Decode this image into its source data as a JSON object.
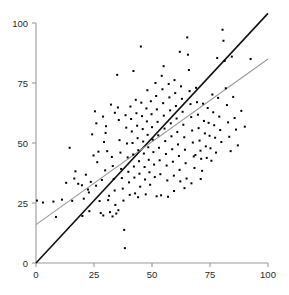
{
  "chart_data": {
    "type": "scatter",
    "title": "",
    "xlabel": "",
    "ylabel": "",
    "xlim": [
      0,
      100
    ],
    "ylim": [
      0,
      100
    ],
    "xticks": [
      0,
      25,
      50,
      75,
      100
    ],
    "yticks": [
      0,
      25,
      50,
      75,
      100
    ],
    "xticklabels": [
      "0",
      "25",
      "50",
      "75",
      "100"
    ],
    "yticklabels": [
      "0",
      "25",
      "50",
      "75",
      "100"
    ],
    "grid": false,
    "legend": null,
    "marker": "square",
    "marker_size": 2,
    "marker_color": "#000000",
    "axis_color": "#999999",
    "background_color": "#ffffff",
    "lines": [
      {
        "name": "identity-line",
        "color": "#111111",
        "width": 1.6,
        "x": [
          0,
          100
        ],
        "y": [
          0,
          104
        ],
        "slope": 1.04,
        "intercept": 0
      },
      {
        "name": "regression-line",
        "color": "#9a9a9a",
        "width": 1.1,
        "x": [
          0,
          100
        ],
        "y": [
          16,
          85
        ],
        "slope": 0.69,
        "intercept": 16
      }
    ],
    "points": [
      [
        0.4,
        26.0
      ],
      [
        3.0,
        25.2
      ],
      [
        7.5,
        25.6
      ],
      [
        8.6,
        19.2
      ],
      [
        11.2,
        26.4
      ],
      [
        14.5,
        48.0
      ],
      [
        15.6,
        25.9
      ],
      [
        17.0,
        38.2
      ],
      [
        18.2,
        33.0
      ],
      [
        19.8,
        32.4
      ],
      [
        20.6,
        26.8
      ],
      [
        21.5,
        36.8
      ],
      [
        22.4,
        30.6
      ],
      [
        23.0,
        21.6
      ],
      [
        23.6,
        33.8
      ],
      [
        24.2,
        53.6
      ],
      [
        24.8,
        44.8
      ],
      [
        25.4,
        63.2
      ],
      [
        25.9,
        32.2
      ],
      [
        26.4,
        42.0
      ],
      [
        26.9,
        46.4
      ],
      [
        27.4,
        25.8
      ],
      [
        27.9,
        20.8
      ],
      [
        28.4,
        34.6
      ],
      [
        28.9,
        61.0
      ],
      [
        29.3,
        50.4
      ],
      [
        29.8,
        38.6
      ],
      [
        30.2,
        57.0
      ],
      [
        30.7,
        46.6
      ],
      [
        31.1,
        26.2
      ],
      [
        31.5,
        28.0
      ],
      [
        31.9,
        21.2
      ],
      [
        32.3,
        66.0
      ],
      [
        32.7,
        44.2
      ],
      [
        33.1,
        40.4
      ],
      [
        33.5,
        35.0
      ],
      [
        33.9,
        30.2
      ],
      [
        34.2,
        24.2
      ],
      [
        34.6,
        20.6
      ],
      [
        35.0,
        78.4
      ],
      [
        35.3,
        64.8
      ],
      [
        35.7,
        59.6
      ],
      [
        36.0,
        51.2
      ],
      [
        36.4,
        46.0
      ],
      [
        36.7,
        39.2
      ],
      [
        37.0,
        35.4
      ],
      [
        37.4,
        31.0
      ],
      [
        37.7,
        26.0
      ],
      [
        38.0,
        13.8
      ],
      [
        38.3,
        6.2
      ],
      [
        38.6,
        61.6
      ],
      [
        38.9,
        56.4
      ],
      [
        39.2,
        49.8
      ],
      [
        39.5,
        44.0
      ],
      [
        39.8,
        38.0
      ],
      [
        40.1,
        33.6
      ],
      [
        40.4,
        28.4
      ],
      [
        40.7,
        65.2
      ],
      [
        41.0,
        60.0
      ],
      [
        41.3,
        54.8
      ],
      [
        41.6,
        50.0
      ],
      [
        41.9,
        45.2
      ],
      [
        42.2,
        40.2
      ],
      [
        42.4,
        35.6
      ],
      [
        42.7,
        29.0
      ],
      [
        43.0,
        68.0
      ],
      [
        43.3,
        62.4
      ],
      [
        43.6,
        57.2
      ],
      [
        43.8,
        52.0
      ],
      [
        44.1,
        47.0
      ],
      [
        44.4,
        42.4
      ],
      [
        44.6,
        37.2
      ],
      [
        44.9,
        31.8
      ],
      [
        45.2,
        90.2
      ],
      [
        45.4,
        66.8
      ],
      [
        45.7,
        61.2
      ],
      [
        46.0,
        55.8
      ],
      [
        46.2,
        50.6
      ],
      [
        46.5,
        45.6
      ],
      [
        46.8,
        40.0
      ],
      [
        47.0,
        34.8
      ],
      [
        47.3,
        28.6
      ],
      [
        47.6,
        64.4
      ],
      [
        47.8,
        59.0
      ],
      [
        48.1,
        53.4
      ],
      [
        48.4,
        48.2
      ],
      [
        48.6,
        43.0
      ],
      [
        48.9,
        37.8
      ],
      [
        49.2,
        32.6
      ],
      [
        49.5,
        67.4
      ],
      [
        49.8,
        62.0
      ],
      [
        50.0,
        56.6
      ],
      [
        50.3,
        51.4
      ],
      [
        50.6,
        46.2
      ],
      [
        50.9,
        41.0
      ],
      [
        51.2,
        35.8
      ],
      [
        51.5,
        75.0
      ],
      [
        51.8,
        69.6
      ],
      [
        52.1,
        64.0
      ],
      [
        52.4,
        58.8
      ],
      [
        52.7,
        53.2
      ],
      [
        53.0,
        48.0
      ],
      [
        53.3,
        42.8
      ],
      [
        53.6,
        37.0
      ],
      [
        53.9,
        28.2
      ],
      [
        54.2,
        78.0
      ],
      [
        54.5,
        72.4
      ],
      [
        54.8,
        66.6
      ],
      [
        55.1,
        61.4
      ],
      [
        55.4,
        56.0
      ],
      [
        55.7,
        50.8
      ],
      [
        56.0,
        45.4
      ],
      [
        56.3,
        40.6
      ],
      [
        56.6,
        34.4
      ],
      [
        56.9,
        27.6
      ],
      [
        57.2,
        74.6
      ],
      [
        57.5,
        69.0
      ],
      [
        57.8,
        63.6
      ],
      [
        58.1,
        58.2
      ],
      [
        58.4,
        52.8
      ],
      [
        58.7,
        47.4
      ],
      [
        59.0,
        42.2
      ],
      [
        59.4,
        36.4
      ],
      [
        59.7,
        76.2
      ],
      [
        60.0,
        70.8
      ],
      [
        60.3,
        65.4
      ],
      [
        60.6,
        60.2
      ],
      [
        60.9,
        54.6
      ],
      [
        61.2,
        49.4
      ],
      [
        61.6,
        44.6
      ],
      [
        61.9,
        38.8
      ],
      [
        62.2,
        34.0
      ],
      [
        62.5,
        73.6
      ],
      [
        62.9,
        68.4
      ],
      [
        63.2,
        63.0
      ],
      [
        63.5,
        57.6
      ],
      [
        63.9,
        52.4
      ],
      [
        64.2,
        47.2
      ],
      [
        64.5,
        41.6
      ],
      [
        64.9,
        35.2
      ],
      [
        65.2,
        94.0
      ],
      [
        65.5,
        86.8
      ],
      [
        65.9,
        80.4
      ],
      [
        66.2,
        71.6
      ],
      [
        66.6,
        66.2
      ],
      [
        66.9,
        60.8
      ],
      [
        67.3,
        55.2
      ],
      [
        67.6,
        50.2
      ],
      [
        68.0,
        44.4
      ],
      [
        68.3,
        39.6
      ],
      [
        68.7,
        45.0
      ],
      [
        69.0,
        73.0
      ],
      [
        69.4,
        67.0
      ],
      [
        69.8,
        61.8
      ],
      [
        70.1,
        56.2
      ],
      [
        70.5,
        51.0
      ],
      [
        70.9,
        46.8
      ],
      [
        71.2,
        43.4
      ],
      [
        71.6,
        38.4
      ],
      [
        72.0,
        66.4
      ],
      [
        72.4,
        59.2
      ],
      [
        72.8,
        54.0
      ],
      [
        73.2,
        48.6
      ],
      [
        73.6,
        43.8
      ],
      [
        74.0,
        64.6
      ],
      [
        74.4,
        58.4
      ],
      [
        74.8,
        53.0
      ],
      [
        75.2,
        47.8
      ],
      [
        75.6,
        42.6
      ],
      [
        76.0,
        70.2
      ],
      [
        76.4,
        62.8
      ],
      [
        76.8,
        57.4
      ],
      [
        77.2,
        52.2
      ],
      [
        77.6,
        46.0
      ],
      [
        78.1,
        85.4
      ],
      [
        78.5,
        68.8
      ],
      [
        79.0,
        61.0
      ],
      [
        79.4,
        55.4
      ],
      [
        79.9,
        50.4
      ],
      [
        80.4,
        97.2
      ],
      [
        80.8,
        92.6
      ],
      [
        81.3,
        84.2
      ],
      [
        81.8,
        72.8
      ],
      [
        82.3,
        65.8
      ],
      [
        82.8,
        58.6
      ],
      [
        83.3,
        52.6
      ],
      [
        83.9,
        46.6
      ],
      [
        84.4,
        86.0
      ],
      [
        85.0,
        69.2
      ],
      [
        85.6,
        60.4
      ],
      [
        86.2,
        55.6
      ],
      [
        87.0,
        49.0
      ],
      [
        88.5,
        63.4
      ],
      [
        90.0,
        56.8
      ],
      [
        92.5,
        85.0
      ],
      [
        20.0,
        19.6
      ],
      [
        29.0,
        19.8
      ],
      [
        33.0,
        19.4
      ],
      [
        35.5,
        22.0
      ],
      [
        44.0,
        27.4
      ],
      [
        52.0,
        27.8
      ],
      [
        59.5,
        30.0
      ],
      [
        64.0,
        31.2
      ],
      [
        67.0,
        33.2
      ],
      [
        71.0,
        35.0
      ],
      [
        13.0,
        33.4
      ],
      [
        16.5,
        35.2
      ],
      [
        22.8,
        29.4
      ],
      [
        26.0,
        58.2
      ],
      [
        30.0,
        54.2
      ],
      [
        34.0,
        62.6
      ],
      [
        42.0,
        80.0
      ],
      [
        48.0,
        72.0
      ],
      [
        55.0,
        82.0
      ],
      [
        62.0,
        88.0
      ]
    ]
  }
}
